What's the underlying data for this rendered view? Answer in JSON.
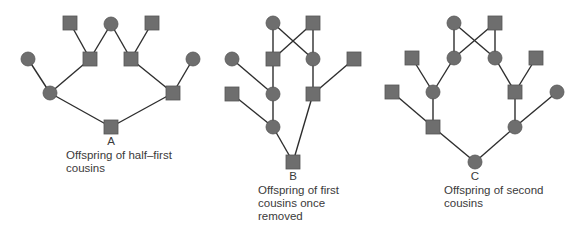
{
  "style": {
    "node_fill": "#6e6e6e",
    "node_stroke": "#555555",
    "edge_color": "#2e2e2e",
    "node_size": 14
  },
  "pedigrees": [
    {
      "id": "A",
      "letter": "A",
      "caption_lines": [
        "Offspring of half–first",
        "cousins"
      ],
      "nodes": [
        {
          "id": "a1",
          "shape": "square",
          "x": 70,
          "y": 23
        },
        {
          "id": "a2",
          "shape": "circle",
          "x": 111,
          "y": 24
        },
        {
          "id": "a3",
          "shape": "square",
          "x": 152,
          "y": 23
        },
        {
          "id": "a4",
          "shape": "circle",
          "x": 28,
          "y": 59
        },
        {
          "id": "a5",
          "shape": "square",
          "x": 90,
          "y": 59
        },
        {
          "id": "a6",
          "shape": "square",
          "x": 131,
          "y": 59
        },
        {
          "id": "a7",
          "shape": "circle",
          "x": 193,
          "y": 59
        },
        {
          "id": "a8",
          "shape": "circle",
          "x": 50,
          "y": 93
        },
        {
          "id": "a9",
          "shape": "square",
          "x": 173,
          "y": 93
        },
        {
          "id": "a10",
          "shape": "square",
          "x": 111,
          "y": 127
        }
      ],
      "edges": [
        [
          "a1",
          "a5"
        ],
        [
          "a2",
          "a5"
        ],
        [
          "a2",
          "a6"
        ],
        [
          "a3",
          "a6"
        ],
        [
          "a4",
          "a8"
        ],
        [
          "a5",
          "a8"
        ],
        [
          "a6",
          "a9"
        ],
        [
          "a7",
          "a9"
        ],
        [
          "a8",
          "a10"
        ],
        [
          "a9",
          "a10"
        ]
      ]
    },
    {
      "id": "B",
      "letter": "B",
      "caption_lines": [
        "Offspring of first",
        "cousins once",
        "removed"
      ],
      "nodes": [
        {
          "id": "b1",
          "shape": "circle",
          "x": 273,
          "y": 23
        },
        {
          "id": "b2",
          "shape": "square",
          "x": 313,
          "y": 23
        },
        {
          "id": "b3",
          "shape": "circle",
          "x": 232,
          "y": 59
        },
        {
          "id": "b4",
          "shape": "square",
          "x": 273,
          "y": 59
        },
        {
          "id": "b5",
          "shape": "circle",
          "x": 313,
          "y": 59
        },
        {
          "id": "b6",
          "shape": "square",
          "x": 354,
          "y": 59
        },
        {
          "id": "b7",
          "shape": "square",
          "x": 232,
          "y": 94
        },
        {
          "id": "b8",
          "shape": "circle",
          "x": 273,
          "y": 94
        },
        {
          "id": "b9",
          "shape": "square",
          "x": 313,
          "y": 94
        },
        {
          "id": "b10",
          "shape": "circle",
          "x": 273,
          "y": 127
        },
        {
          "id": "b11",
          "shape": "square",
          "x": 293,
          "y": 162
        }
      ],
      "edges": [
        [
          "b1",
          "b4"
        ],
        [
          "b1",
          "b5"
        ],
        [
          "b2",
          "b4"
        ],
        [
          "b2",
          "b5"
        ],
        [
          "b3",
          "b8"
        ],
        [
          "b4",
          "b8"
        ],
        [
          "b5",
          "b9"
        ],
        [
          "b6",
          "b9"
        ],
        [
          "b7",
          "b10"
        ],
        [
          "b8",
          "b10"
        ],
        [
          "b10",
          "b11"
        ],
        [
          "b9",
          "b11"
        ]
      ]
    },
    {
      "id": "C",
      "letter": "C",
      "caption_lines": [
        "Offspring of second",
        "cousins"
      ],
      "nodes": [
        {
          "id": "c1",
          "shape": "circle",
          "x": 454,
          "y": 23
        },
        {
          "id": "c2",
          "shape": "square",
          "x": 495,
          "y": 23
        },
        {
          "id": "c3",
          "shape": "square",
          "x": 412,
          "y": 58
        },
        {
          "id": "c4",
          "shape": "circle",
          "x": 454,
          "y": 58
        },
        {
          "id": "c5",
          "shape": "circle",
          "x": 495,
          "y": 58
        },
        {
          "id": "c6",
          "shape": "square",
          "x": 536,
          "y": 58
        },
        {
          "id": "c7",
          "shape": "square",
          "x": 392,
          "y": 92
        },
        {
          "id": "c8",
          "shape": "circle",
          "x": 433,
          "y": 92
        },
        {
          "id": "c9",
          "shape": "square",
          "x": 515,
          "y": 92
        },
        {
          "id": "c10",
          "shape": "circle",
          "x": 557,
          "y": 92
        },
        {
          "id": "c11",
          "shape": "square",
          "x": 433,
          "y": 127
        },
        {
          "id": "c12",
          "shape": "circle",
          "x": 515,
          "y": 127
        },
        {
          "id": "c13",
          "shape": "circle",
          "x": 475,
          "y": 162
        }
      ],
      "edges": [
        [
          "c1",
          "c4"
        ],
        [
          "c1",
          "c5"
        ],
        [
          "c2",
          "c4"
        ],
        [
          "c2",
          "c5"
        ],
        [
          "c3",
          "c8"
        ],
        [
          "c4",
          "c8"
        ],
        [
          "c5",
          "c9"
        ],
        [
          "c6",
          "c9"
        ],
        [
          "c7",
          "c11"
        ],
        [
          "c8",
          "c11"
        ],
        [
          "c9",
          "c12"
        ],
        [
          "c10",
          "c12"
        ],
        [
          "c11",
          "c13"
        ],
        [
          "c12",
          "c13"
        ]
      ]
    }
  ],
  "labels": {
    "A": {
      "letter_x": 101,
      "letter_y": 135,
      "caption_x": 66,
      "caption_y": 149
    },
    "B": {
      "letter_x": 283,
      "letter_y": 170,
      "caption_x": 258,
      "caption_y": 184
    },
    "C": {
      "letter_x": 465,
      "letter_y": 170,
      "caption_x": 444,
      "caption_y": 184
    }
  }
}
